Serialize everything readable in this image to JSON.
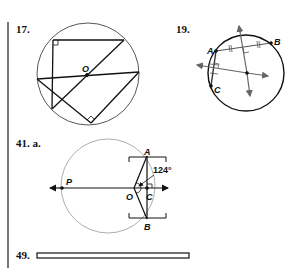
{
  "problems": [
    {
      "number": "17."
    },
    {
      "number": "19.",
      "points": {
        "a": "A",
        "b": "B",
        "c": "C"
      }
    },
    {
      "number": "41. a.",
      "points": {
        "a": "A",
        "b": "B",
        "c": "C",
        "o": "O",
        "p": "P"
      },
      "angle": "124°"
    },
    {
      "number": "49."
    }
  ],
  "fig17": {
    "center_label": "O"
  }
}
